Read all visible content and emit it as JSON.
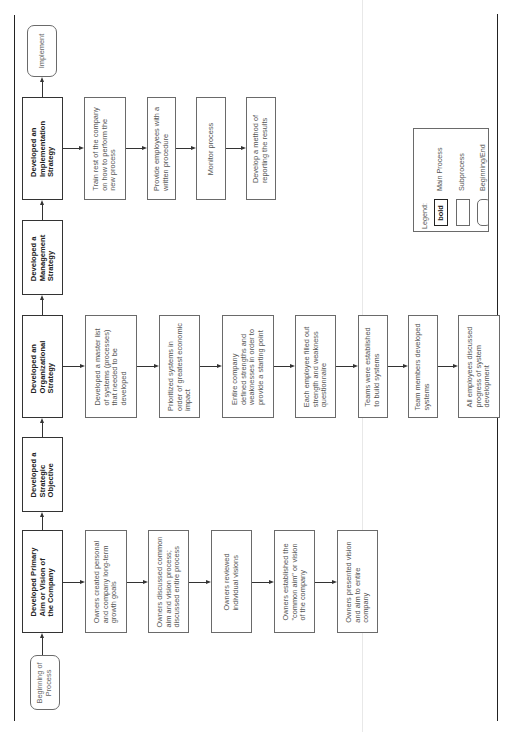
{
  "diagram": {
    "orientation": "rotated-90-ccw",
    "main_process": [
      {
        "id": "implement",
        "label": "Implement",
        "type": "beginning-end"
      },
      {
        "id": "implementation_strategy",
        "label": "Developed an\nImplementation\nStrategy",
        "type": "main"
      },
      {
        "id": "management_strategy",
        "label": "Developed a\nManagement\nStrategy",
        "type": "main"
      },
      {
        "id": "organizational_strategy",
        "label": "Developed an\nOrganizational\nStrategy",
        "type": "main"
      },
      {
        "id": "strategic_objective",
        "label": "Developed a\nStrategic\nObjective",
        "type": "main"
      },
      {
        "id": "primary_aim",
        "label": "Developed Primary\nAim or Vision of\nthe Company",
        "type": "main"
      },
      {
        "id": "beginning",
        "label": "Beginning of\nProcess",
        "type": "beginning-end"
      }
    ],
    "implementation_subprocesses": [
      "Train rest of the company\non how to perform the\nnew process",
      "Provide employees with a\nwritten procedure",
      "Monitor process",
      "Develop a method of\nreporting the results"
    ],
    "organizational_subprocesses": [
      "Developed a master list\nof systems (processes)\nthat needed to be\ndeveloped",
      "Prioritized systems in\norder of greatest economic\nimpact",
      "Entire company\ndefined strengths and\nweaknesses in order to\nprovide a starting point",
      "Each employee filled out\nstrength and weakness\nquestionnaire",
      "Teams were established\nto build systems",
      "Team members developed\nsystems",
      "All employees discussed\nprogress of system\ndevelopment"
    ],
    "primary_aim_subprocesses": [
      "Owners created personal\nand company long-term\ngrowth goals",
      "Owners discussed common\naim and vision process;\ndiscussed entire process",
      "Owners reviewed\nindividual visions",
      "Owners established the\n\"common aim\" or vision\nof the company",
      "Owners presented vision\nand aim to entire\ncompany"
    ],
    "legend": {
      "title": "Legend:",
      "items": [
        {
          "swatch": "bold",
          "label": "Main Process"
        },
        {
          "swatch": "",
          "label": "Subprocess"
        },
        {
          "swatch": "",
          "label": "Beginning/End"
        }
      ]
    },
    "colors": {
      "main_border": "#333333",
      "sub_border": "#6a6a6a",
      "text": "#444444",
      "background": "#ffffff"
    }
  }
}
